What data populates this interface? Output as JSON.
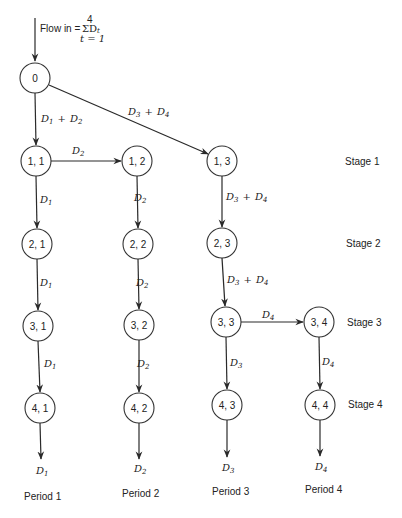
{
  "flow_in": {
    "prefix": "Flow in =",
    "sum_top": "4",
    "sum_symbol": "ΣD",
    "sum_var": "t",
    "sum_bottom": "t = 1"
  },
  "nodes": [
    {
      "id": "0",
      "label": "0",
      "x": 35,
      "y": 78
    },
    {
      "id": "1,1",
      "label": "1, 1",
      "x": 36,
      "y": 161
    },
    {
      "id": "1,2",
      "label": "1, 2",
      "x": 137,
      "y": 161
    },
    {
      "id": "1,3",
      "label": "1, 3",
      "x": 222,
      "y": 161
    },
    {
      "id": "2,1",
      "label": "2, 1",
      "x": 37,
      "y": 244
    },
    {
      "id": "2,2",
      "label": "2, 2",
      "x": 138,
      "y": 244
    },
    {
      "id": "2,3",
      "label": "2, 3",
      "x": 222,
      "y": 243
    },
    {
      "id": "3,1",
      "label": "3, 1",
      "x": 38,
      "y": 326
    },
    {
      "id": "3,2",
      "label": "3, 2",
      "x": 139,
      "y": 325
    },
    {
      "id": "3,3",
      "label": "3, 3",
      "x": 226,
      "y": 322
    },
    {
      "id": "3,4",
      "label": "3, 4",
      "x": 319,
      "y": 322
    },
    {
      "id": "4,1",
      "label": "4, 1",
      "x": 40,
      "y": 408
    },
    {
      "id": "4,2",
      "label": "4, 2",
      "x": 139,
      "y": 408
    },
    {
      "id": "4,3",
      "label": "4, 3",
      "x": 227,
      "y": 405
    },
    {
      "id": "4,4",
      "label": "4, 4",
      "x": 320,
      "y": 405
    }
  ],
  "edge_labels": {
    "e0_11": {
      "a": "D",
      "as": "1",
      "b": "D",
      "bs": "2"
    },
    "e0_13": {
      "a": "D",
      "as": "3",
      "b": "D",
      "bs": "4"
    },
    "e11_12": {
      "a": "D",
      "as": "2"
    },
    "e11_21": {
      "a": "D",
      "as": "1"
    },
    "e12_22": {
      "a": "D",
      "as": "2"
    },
    "e13_23": {
      "a": "D",
      "as": "3",
      "b": "D",
      "bs": "4"
    },
    "e21_31": {
      "a": "D",
      "as": "1"
    },
    "e22_32": {
      "a": "D",
      "as": "2"
    },
    "e23_33": {
      "a": "D",
      "as": "3",
      "b": "D",
      "bs": "4"
    },
    "e33_34": {
      "a": "D",
      "as": "4"
    },
    "e31_41": {
      "a": "D",
      "as": "1"
    },
    "e32_42": {
      "a": "D",
      "as": "2"
    },
    "e33_43": {
      "a": "D",
      "as": "3"
    },
    "e34_44": {
      "a": "D",
      "as": "4"
    }
  },
  "outputs": [
    {
      "a": "D",
      "as": "1"
    },
    {
      "a": "D",
      "as": "2"
    },
    {
      "a": "D",
      "as": "3"
    },
    {
      "a": "D",
      "as": "4"
    }
  ],
  "stages": [
    "Stage 1",
    "Stage 2",
    "Stage 3",
    "Stage 4"
  ],
  "periods": [
    "Period 1",
    "Period 2",
    "Period 3",
    "Period 4"
  ],
  "plus": "+"
}
